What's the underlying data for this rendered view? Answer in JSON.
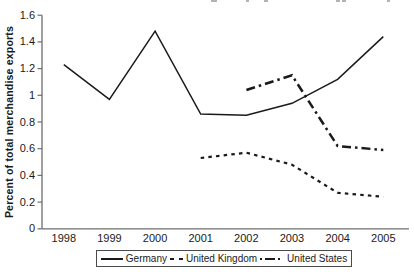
{
  "figure": {
    "line_color": "#1a1a1a",
    "background": "#ffffff"
  },
  "chart_data": {
    "type": "line",
    "title": "",
    "xlabel": "",
    "ylabel": "Percent of total merchandise exports",
    "x": [
      1998,
      1999,
      2000,
      2001,
      2002,
      2003,
      2004,
      2005
    ],
    "x_tick_labels": [
      "1998",
      "1999",
      "2000",
      "2001",
      "2002",
      "2003",
      "2004",
      "2005"
    ],
    "y_ticks": [
      0,
      0.2,
      0.4,
      0.6,
      0.8,
      1.0,
      1.2,
      1.4,
      1.6
    ],
    "y_tick_labels": [
      "0",
      "0.2",
      "0.4",
      "0.6",
      "0.8",
      "1",
      "1.2",
      "1.4",
      "1.6"
    ],
    "ylim": [
      0,
      1.6
    ],
    "grid": false,
    "legend_position": "bottom",
    "series": [
      {
        "name": "Germany",
        "style": "solid",
        "x": [
          1998,
          1999,
          2000,
          2001,
          2002,
          2003,
          2004,
          2005
        ],
        "values": [
          1.23,
          0.97,
          1.48,
          0.86,
          0.85,
          0.94,
          1.12,
          1.44
        ]
      },
      {
        "name": "United Kingdom",
        "style": "dashed",
        "x": [
          2001,
          2002,
          2003,
          2004,
          2005
        ],
        "values": [
          0.53,
          0.57,
          0.48,
          0.27,
          0.24
        ]
      },
      {
        "name": "United States",
        "style": "dash-dot",
        "x": [
          2002,
          2003,
          2004,
          2005
        ],
        "values": [
          1.04,
          1.15,
          0.62,
          0.59
        ]
      }
    ]
  }
}
